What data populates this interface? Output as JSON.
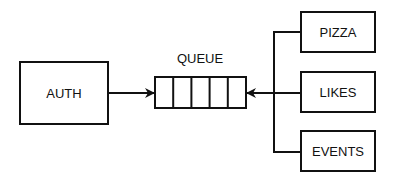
{
  "diagram": {
    "nodes": {
      "auth": {
        "label": "AUTH"
      },
      "queue": {
        "label": "QUEUE",
        "cells": 5
      },
      "pizza": {
        "label": "PIZZA"
      },
      "likes": {
        "label": "LIKES"
      },
      "events": {
        "label": "EVENTS"
      }
    },
    "edges": [
      {
        "from": "AUTH",
        "to": "QUEUE"
      },
      {
        "from": "PIZZA",
        "to": "QUEUE"
      },
      {
        "from": "LIKES",
        "to": "QUEUE"
      },
      {
        "from": "EVENTS",
        "to": "QUEUE"
      }
    ],
    "colors": {
      "stroke": "#111111",
      "background": "#ffffff"
    }
  }
}
